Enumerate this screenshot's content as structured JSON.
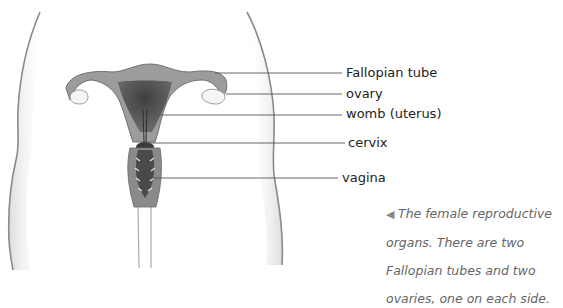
{
  "labels": {
    "fallopian_tube": "Fallopian tube",
    "ovary": "ovary",
    "womb": "womb (uterus)",
    "cervix": "cervix",
    "vagina": "vagina"
  },
  "caption": {
    "arrow": "◀",
    "text": "The female reproductive organs. There are two Fallopian tubes and two ovaries, one on each side."
  },
  "colors": {
    "outline": "#8a8a8a",
    "tissue_light": "#a9a9a9",
    "tissue_mid": "#7d7d7d",
    "tissue_dark": "#4e4e4e",
    "ovary": "#f2f2f2",
    "leader_line": "#555555"
  }
}
